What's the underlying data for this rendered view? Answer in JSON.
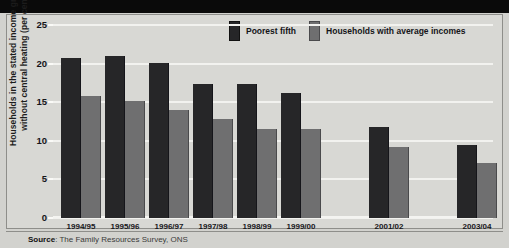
{
  "chart_data": {
    "type": "bar",
    "title": "",
    "xlabel": "",
    "ylabel": "Households in the stated income groups\nwithout central heating (per cent)",
    "ylim": [
      0,
      25
    ],
    "yticks": [
      0,
      5,
      10,
      15,
      20,
      25
    ],
    "ytick_labels": [
      "0",
      "5",
      "10",
      "15",
      "20",
      "25"
    ],
    "grid": true,
    "legend_position": "top-right",
    "categories": [
      "1994/95",
      "1995/96",
      "1996/97",
      "1997/98",
      "1998/99",
      "1999/00",
      "2001/02",
      "2003/04"
    ],
    "series": [
      {
        "name": "Poorest fifth",
        "color": "#262628",
        "values": [
          20.7,
          21.0,
          20.1,
          17.4,
          17.3,
          16.2,
          11.8,
          9.5
        ]
      },
      {
        "name": "Households with average incomes",
        "color": "#6f6f70",
        "values": [
          15.8,
          15.2,
          14.0,
          12.8,
          11.5,
          11.5,
          9.2,
          7.1
        ]
      }
    ]
  },
  "legend": {
    "items": [
      {
        "label": "Poorest fifth"
      },
      {
        "label": "Households with average incomes"
      }
    ]
  },
  "source": {
    "prefix": "Source",
    "separator": ": ",
    "text": "The Family Resources Survey, ONS"
  },
  "colors": {
    "series_dark": "#262628",
    "series_light": "#6f6f70",
    "panel_background": "#d8d8d4",
    "gridline": "#f2f2ef",
    "top_band": "#0a0a0a"
  }
}
